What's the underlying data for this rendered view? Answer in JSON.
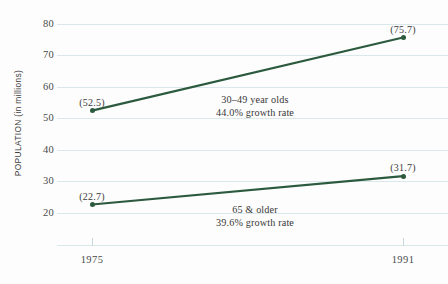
{
  "chart_data": {
    "type": "line",
    "title": "",
    "subtitle": "",
    "xlabel": "",
    "ylabel": "POPULATION (in millions)",
    "x": [
      "1975",
      "1991"
    ],
    "xtick_labels": [
      "1975",
      "1991"
    ],
    "ytick_labels": [
      "20",
      "30",
      "40",
      "50",
      "60",
      "70",
      "80"
    ],
    "ytick_values": [
      20,
      30,
      40,
      50,
      60,
      70,
      80
    ],
    "ylim": [
      14,
      80
    ],
    "xlim": [
      1975,
      1991
    ],
    "grid": "horizontal",
    "legend_position": "inline-annotation",
    "accent_color": "#2c5a3e",
    "gridline_color": "#dbe8eb",
    "background_color": "#fdfdfd",
    "series": [
      {
        "name": "30–49 year olds",
        "values": [
          52.5,
          75.7
        ],
        "point_labels": [
          "(52.5)",
          "(75.7)"
        ],
        "growth_rate": "44.0% growth rate",
        "annotation_line1": "30–49 year olds",
        "annotation_line2": "44.0% growth rate"
      },
      {
        "name": "65 & older",
        "values": [
          22.7,
          31.7
        ],
        "point_labels": [
          "(22.7)",
          "(31.7)"
        ],
        "growth_rate": "39.6% growth rate",
        "annotation_line1": "65 & older",
        "annotation_line2": "39.6% growth rate"
      }
    ]
  }
}
